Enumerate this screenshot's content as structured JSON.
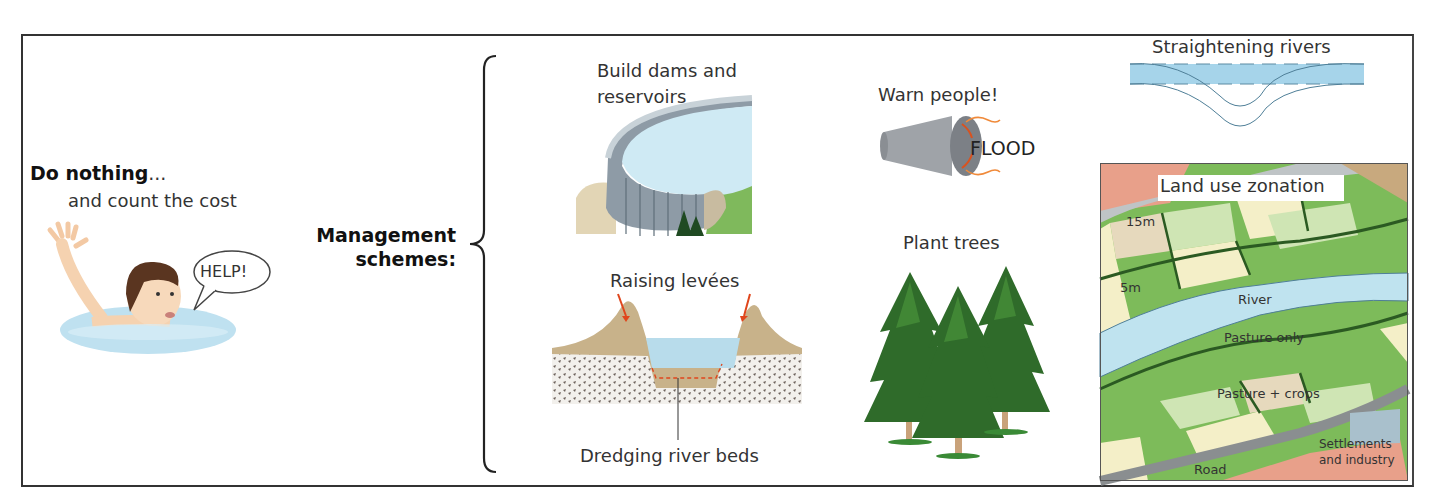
{
  "diagram": {
    "do_nothing": {
      "heading": "Do nothing",
      "ellipsis": "...",
      "subtext": "and count the cost",
      "speech_bubble": "HELP!",
      "illustration": "drowning-person"
    },
    "management": {
      "label_line1": "Management",
      "label_line2": "schemes:",
      "schemes": [
        {
          "id": "dams",
          "label_line1": "Build dams and",
          "label_line2": "reservoirs",
          "illustration": "dam-reservoir"
        },
        {
          "id": "warn",
          "label": "Warn people!",
          "megaphone_text": "FLOOD",
          "illustration": "megaphone"
        },
        {
          "id": "straighten",
          "label": "Straightening rivers",
          "illustration": "river-meander-cut"
        },
        {
          "id": "levees",
          "label": "Raising levées",
          "sublabel": "Dredging river beds",
          "illustration": "levee-cross-section"
        },
        {
          "id": "trees",
          "label": "Plant trees",
          "illustration": "conifer-trees"
        },
        {
          "id": "zonation",
          "label": "Land use zonation",
          "illustration": "land-use-map",
          "map_labels": {
            "contour_high": "15m",
            "contour_low": "5m",
            "river": "River",
            "pasture_only": "Pasture only",
            "pasture_crops": "Pasture + crops",
            "settlements_line1": "Settlements",
            "settlements_line2": "and industry",
            "road": "Road"
          }
        }
      ]
    },
    "colors": {
      "border": "#333333",
      "water": "#bfe3ef",
      "field_green": "#7dbb5a",
      "field_light": "#cfe5b4",
      "field_cream": "#f4efc8",
      "field_beige": "#e6d9bd",
      "levee_soil": "#c8b28a",
      "arrow_red": "#e0461c",
      "tree_green": "#2f6b2a"
    }
  }
}
